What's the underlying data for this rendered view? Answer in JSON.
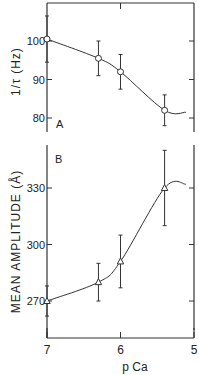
{
  "chart_data": [
    {
      "panel": "A",
      "type": "line",
      "title": "",
      "panel_label": "A",
      "xlabel": "",
      "ylabel": "1/τ (Hz)",
      "x": [
        7.0,
        6.3,
        6.0,
        5.4
      ],
      "values": [
        100.5,
        95.5,
        92,
        82
      ],
      "errors": [
        6,
        4.5,
        4.5,
        4
      ],
      "marker": "circle",
      "xlim": [
        7,
        5
      ],
      "ylim": [
        76,
        110
      ],
      "yticks": [
        80,
        90,
        100
      ],
      "ytick_labels": [
        "80",
        "90",
        "100"
      ],
      "fit_curve": "sigmoid",
      "grid": false
    },
    {
      "panel": "B",
      "type": "line",
      "title": "",
      "panel_label": "B",
      "xlabel": "p Ca",
      "ylabel": "MEAN AMPLITUDE (Å)",
      "x": [
        7.0,
        6.3,
        6.0,
        5.4
      ],
      "values": [
        270,
        280,
        291,
        330
      ],
      "errors": [
        8,
        10,
        14,
        20
      ],
      "marker": "triangle",
      "xlim": [
        7,
        5
      ],
      "ylim": [
        250,
        353
      ],
      "xticks": [
        7,
        6,
        5
      ],
      "xtick_labels": [
        "7",
        "6",
        "5"
      ],
      "yticks": [
        270,
        300,
        330
      ],
      "ytick_labels": [
        "270",
        "300",
        "330"
      ],
      "fit_curve": "sigmoid",
      "grid": false
    }
  ],
  "labels": {
    "panel_a": "A",
    "panel_b": "B",
    "ylabel_a": "1/τ (Hz)",
    "ylabel_b": "MEAN AMPLITUDE (Å)",
    "xlabel": "p Ca"
  }
}
